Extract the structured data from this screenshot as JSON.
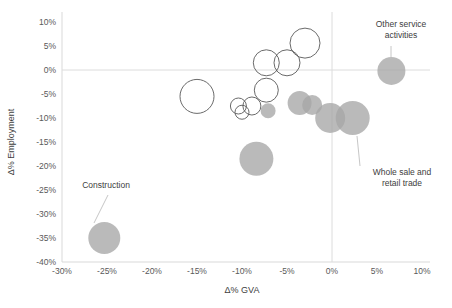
{
  "chart_data": {
    "type": "scatter",
    "title": "",
    "xlabel": "Δ% GVA",
    "ylabel": "Δ% Employment",
    "xlim": [
      -30,
      10
    ],
    "ylim": [
      -40,
      10
    ],
    "xticks": [
      "-30%",
      "-25%",
      "-20%",
      "-15%",
      "-10%",
      "-5%",
      "0%",
      "5%",
      "10%"
    ],
    "xtick_values": [
      -30,
      -25,
      -20,
      -15,
      -10,
      -5,
      0,
      5,
      10
    ],
    "yticks": [
      "10%",
      "5%",
      "0%",
      "-5%",
      "-10%",
      "-15%",
      "-20%",
      "-25%",
      "-30%",
      "-35%",
      "-40%"
    ],
    "ytick_values": [
      10,
      5,
      0,
      -5,
      -10,
      -15,
      -20,
      -25,
      -30,
      -35,
      -40
    ],
    "grid": false,
    "zero_lines": true,
    "legend": "none",
    "bubble_fill": "#a6a6a6",
    "bubble_stroke": "#595959",
    "points": [
      {
        "label": "Construction",
        "x": -25.3,
        "y": -35.0,
        "size": 16,
        "filled": true
      },
      {
        "label": "",
        "x": -8.4,
        "y": -18.5,
        "size": 17,
        "filled": true
      },
      {
        "label": "",
        "x": -15.0,
        "y": -5.5,
        "size": 17,
        "filled": false
      },
      {
        "label": "",
        "x": -10.4,
        "y": -7.5,
        "size": 8,
        "filled": false
      },
      {
        "label": "",
        "x": -10.0,
        "y": -8.8,
        "size": 7,
        "filled": false
      },
      {
        "label": "",
        "x": -8.9,
        "y": -7.5,
        "size": 9,
        "filled": false
      },
      {
        "label": "",
        "x": -7.1,
        "y": -8.5,
        "size": 7.5,
        "filled": true
      },
      {
        "label": "",
        "x": -7.3,
        "y": -4.2,
        "size": 12,
        "filled": false
      },
      {
        "label": "",
        "x": -7.3,
        "y": 1.5,
        "size": 13,
        "filled": false
      },
      {
        "label": "",
        "x": -5.0,
        "y": 1.5,
        "size": 13,
        "filled": false
      },
      {
        "label": "",
        "x": -3.0,
        "y": 5.6,
        "size": 15,
        "filled": false
      },
      {
        "label": "",
        "x": -3.6,
        "y": -6.9,
        "size": 12,
        "filled": true
      },
      {
        "label": "",
        "x": -2.2,
        "y": -7.3,
        "size": 10,
        "filled": true
      },
      {
        "label": "",
        "x": -0.2,
        "y": -10.0,
        "size": 15,
        "filled": true
      },
      {
        "label": "Whole sale and retail trade",
        "x": 2.3,
        "y": -10.0,
        "size": 17,
        "filled": true
      },
      {
        "label": "Other service activities",
        "x": 6.6,
        "y": -0.2,
        "size": 14,
        "filled": true
      }
    ],
    "annotations": [
      {
        "name": "construction-label",
        "text_line1": "Construction",
        "text_line2": "",
        "text_x": 106,
        "text_y": 188,
        "anchor": "middle",
        "leader": {
          "x1": 108,
          "y1": 195,
          "x2": 94,
          "y2": 223
        }
      },
      {
        "name": "other-service-label",
        "text_line1": "Other service",
        "text_line2": "activities",
        "text_x": 401,
        "text_y": 27,
        "anchor": "middle",
        "leader": {
          "x1": 391,
          "y1": 46,
          "x2": 391,
          "y2": 59
        }
      },
      {
        "name": "wholesale-label",
        "text_line1": "Whole sale and",
        "text_line2": "retail trade",
        "text_x": 402,
        "text_y": 175,
        "anchor": "middle",
        "leader": {
          "x1": 357,
          "y1": 136,
          "x2": 360,
          "y2": 166
        }
      }
    ]
  }
}
